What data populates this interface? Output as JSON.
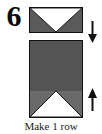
{
  "diagram": {
    "step_number": "6",
    "caption": "Make 1 row",
    "colors": {
      "fabric_dark": "#5a5a5a",
      "fabric_medium": "#6a6a6a",
      "fabric_light": "#ffffff",
      "outline": "#101010",
      "background": "#ffffff",
      "text": "#0d0d0d"
    },
    "units": [
      {
        "name": "flying-geese-unit-top",
        "shape": "rectangle",
        "background": "#5a5a5a",
        "accent": "white-triangle-pointing-down",
        "position": {
          "x": 29,
          "y": 7,
          "width": 54,
          "height": 26
        }
      },
      {
        "name": "block-unit-bottom",
        "shape": "rectangle",
        "background": "#545454",
        "accent": "white-triangle-pointing-up",
        "position": {
          "x": 29,
          "y": 40,
          "width": 54,
          "height": 78
        }
      }
    ],
    "arrows": [
      {
        "name": "arrow-down",
        "direction": "down",
        "position": {
          "x": 86,
          "y": 21
        }
      },
      {
        "name": "arrow-up",
        "direction": "up",
        "position": {
          "x": 86,
          "y": 88
        }
      }
    ]
  }
}
